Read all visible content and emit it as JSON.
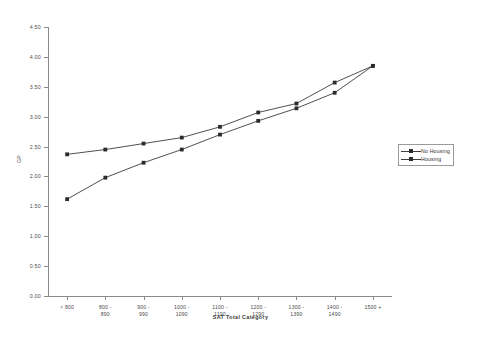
{
  "chart_data": {
    "type": "line",
    "title": "",
    "xlabel": "SAT Total Category",
    "ylabel": "GP",
    "categories": [
      "< 800",
      "800 - 890",
      "900 - 990",
      "1000 - 1090",
      "1100 - 1190",
      "1200 - 1290",
      "1300 - 1390",
      "1400 - 1490",
      "1500 +"
    ],
    "ylim": [
      0.0,
      4.5
    ],
    "yticks": [
      "0.00",
      "0.50",
      "1.00",
      "1.50",
      "2.00",
      "2.50",
      "3.00",
      "3.50",
      "4.00",
      "4.50"
    ],
    "ytick_values": [
      0.0,
      0.5,
      1.0,
      1.5,
      2.0,
      2.5,
      3.0,
      3.5,
      4.0,
      4.5
    ],
    "grid": false,
    "legend_position": "right",
    "series": [
      {
        "name": "No Housing",
        "color": "#3c3c3c",
        "values": [
          2.37,
          2.45,
          2.55,
          2.65,
          2.83,
          3.07,
          3.22,
          3.57,
          3.85
        ]
      },
      {
        "name": "Housing",
        "color": "#3c3c3c",
        "values": [
          1.62,
          1.98,
          2.23,
          2.45,
          2.7,
          2.93,
          3.14,
          3.4,
          3.85
        ]
      }
    ]
  },
  "legend": {
    "items": [
      {
        "label": "No Housing"
      },
      {
        "label": "Housing"
      }
    ]
  }
}
